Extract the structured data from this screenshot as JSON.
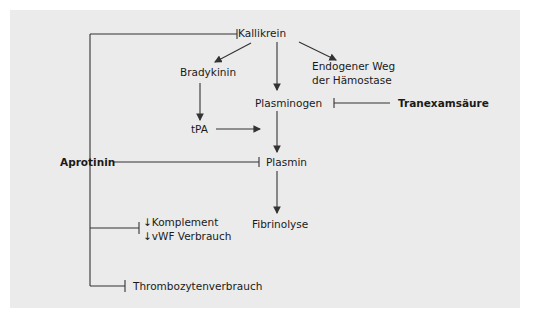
{
  "diagram": {
    "nodes": {
      "kallikrein": "Kallikrein",
      "bradykinin": "Bradykinin",
      "endogenous_line1": "Endogener Weg",
      "endogenous_line2": "der Hämostase",
      "plasminogen": "Plasminogen",
      "tranexamic_acid": "Tranexamsäure",
      "tpa": "tPA",
      "aprotinin": "Aprotinin",
      "plasmin": "Plasmin",
      "fibrinolysis": "Fibrinolyse",
      "complement": "Komplement",
      "vwf": "vWF Verbrauch",
      "platelet": "Thrombozytenverbrauch"
    },
    "decrease_marker": "↓",
    "edges": [
      {
        "from": "Kallikrein",
        "to": "Bradykinin",
        "type": "activates"
      },
      {
        "from": "Kallikrein",
        "to": "Endogener Weg der Hämostase",
        "type": "activates"
      },
      {
        "from": "Kallikrein",
        "to": "Plasminogen",
        "type": "activates"
      },
      {
        "from": "Bradykinin",
        "to": "tPA",
        "type": "activates"
      },
      {
        "from": "tPA",
        "to": "Plasminogen→Plasmin",
        "type": "activates"
      },
      {
        "from": "Plasminogen",
        "to": "Plasmin",
        "type": "activates"
      },
      {
        "from": "Plasmin",
        "to": "Fibrinolyse",
        "type": "activates"
      },
      {
        "from": "Tranexamsäure",
        "to": "Plasminogen",
        "type": "inhibits"
      },
      {
        "from": "Aprotinin",
        "to": "Kallikrein",
        "type": "inhibits"
      },
      {
        "from": "Aprotinin",
        "to": "Plasmin",
        "type": "inhibits"
      },
      {
        "from": "Aprotinin",
        "to": "Komplement / vWF Verbrauch",
        "type": "inhibits"
      },
      {
        "from": "Aprotinin",
        "to": "Thrombozytenverbrauch",
        "type": "inhibits"
      }
    ],
    "colors": {
      "background": "#ebebeb",
      "line": "#333333",
      "text": "#1a1a1a"
    }
  }
}
